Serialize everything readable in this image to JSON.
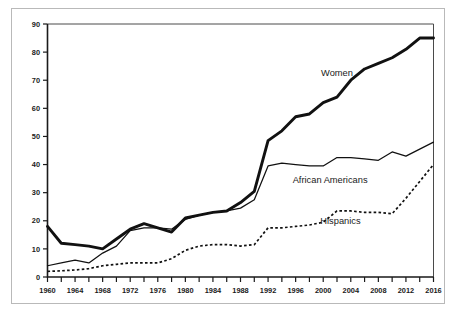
{
  "chart_data": {
    "type": "line",
    "title": "",
    "subtitle": "",
    "xlabel": "",
    "ylabel": "",
    "xlim": [
      1960,
      2016
    ],
    "ylim": [
      0,
      90
    ],
    "grid": false,
    "legend_position": "inline-annotations",
    "y_ticks": [
      0,
      10,
      20,
      30,
      40,
      50,
      60,
      70,
      80,
      90
    ],
    "y_tick_labels": [
      "0",
      "10",
      "20",
      "30",
      "40",
      "50",
      "60",
      "70",
      "80",
      "90"
    ],
    "x_ticks": [
      1960,
      1962,
      1964,
      1966,
      1968,
      1970,
      1972,
      1974,
      1976,
      1978,
      1980,
      1982,
      1984,
      1986,
      1988,
      1990,
      1992,
      1994,
      1996,
      1998,
      2000,
      2002,
      2004,
      2006,
      2008,
      2010,
      2012,
      2014,
      2016
    ],
    "x_tick_labels": [
      "1960",
      "1964",
      "1968",
      "1972",
      "1976",
      "1980",
      "1984",
      "1988",
      "1992",
      "1996",
      "2000",
      "2004",
      "2008",
      "2012",
      "2016"
    ],
    "x_tick_label_years": [
      1960,
      1964,
      1968,
      1972,
      1976,
      1980,
      1984,
      1988,
      1992,
      1996,
      2000,
      2004,
      2008,
      2012,
      2016
    ],
    "x": [
      1960,
      1962,
      1964,
      1966,
      1968,
      1970,
      1972,
      1974,
      1976,
      1978,
      1980,
      1982,
      1984,
      1986,
      1988,
      1990,
      1992,
      1994,
      1996,
      1998,
      2000,
      2002,
      2004,
      2006,
      2008,
      2010,
      2012,
      2014,
      2016
    ],
    "series": [
      {
        "name": "Women",
        "style": "thick-solid",
        "label": "Women",
        "values": [
          18,
          12,
          11.5,
          11,
          10,
          13.5,
          17,
          19,
          17.5,
          16,
          21,
          22,
          23,
          23.5,
          26.5,
          30.5,
          48.5,
          52,
          57,
          58,
          62,
          64,
          70,
          74,
          76,
          78,
          81,
          85,
          85
        ]
      },
      {
        "name": "African Americans",
        "style": "thin-solid",
        "label": "African Americans",
        "values": [
          4,
          5,
          6,
          5,
          8.5,
          11,
          16.5,
          17.5,
          17.5,
          17,
          20.5,
          22,
          23,
          23.5,
          24.5,
          27.5,
          39.5,
          40.5,
          40,
          39.5,
          39.5,
          42.5,
          42.5,
          42,
          41.5,
          44.5,
          43,
          45.5,
          48
        ]
      },
      {
        "name": "Hispanics",
        "style": "dotted",
        "label": "Hispanics",
        "values": [
          2,
          2.2,
          2.5,
          3,
          4,
          4.5,
          5,
          5,
          5,
          6.5,
          9.5,
          11,
          11.5,
          11.5,
          11,
          11.5,
          17.5,
          17.5,
          18,
          18.5,
          19.5,
          23.5,
          23.5,
          23,
          23,
          22.5,
          28,
          34,
          40
        ]
      }
    ],
    "annotations": [
      {
        "text": "Women",
        "x": 2002,
        "y": 71.5
      },
      {
        "text": "African Americans",
        "x": 2001,
        "y": 33.5
      },
      {
        "text": "Hispanics",
        "x": 2002.5,
        "y": 19
      }
    ],
    "colors": {
      "line": "#111111",
      "axis": "#1a1a1a",
      "frame": "#4a4a4a",
      "outer_border": "#b9b9b9",
      "background": "#ffffff",
      "text": "#1a1a1a"
    }
  }
}
